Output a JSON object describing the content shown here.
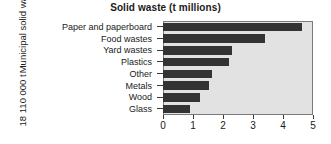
{
  "chart_data": {
    "type": "bar",
    "orientation": "horizontal",
    "title": "Solid waste (t millions)",
    "xlabel": "",
    "ylabel_lines": [
      "Municipal solid waste",
      "18 110 000 t"
    ],
    "categories": [
      "Paper and paperboard",
      "Food wastes",
      "Yard wastes",
      "Plastics",
      "Other",
      "Metals",
      "Wood",
      "Glass"
    ],
    "values": [
      4.63,
      3.4,
      2.3,
      2.2,
      1.63,
      1.53,
      1.23,
      0.9
    ],
    "xlim": [
      0,
      5
    ],
    "xticks": [
      0,
      1,
      2,
      3,
      4,
      5
    ],
    "xtick_labels": [
      "0",
      "1",
      "2",
      "3",
      "4",
      "5"
    ],
    "grid": false,
    "legend": "none",
    "bar_color": "#333333",
    "plot_background": "#e2e2e2",
    "axis_color": "#7a7a7a",
    "figure_background": "#ffffff"
  }
}
